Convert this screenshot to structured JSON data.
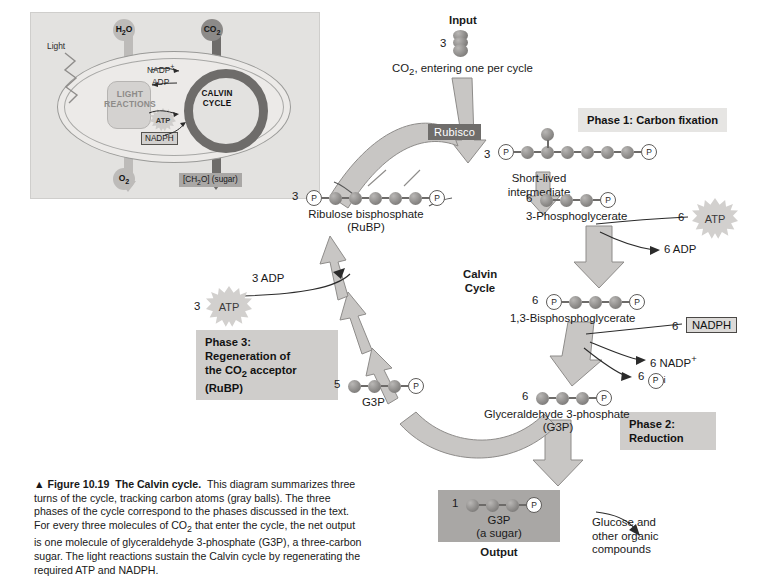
{
  "figure": {
    "number": "Figure 10.19",
    "title": "The Calvin cycle.",
    "caption": "This diagram summarizes three turns of the cycle, tracking carbon atoms (gray balls). The three phases of the cycle correspond to the phases discussed in the text. For every three molecules of CO2 that enter the cycle, the net output is one molecule of glyceraldehyde 3-phosphate (G3P), a three-carbon sugar. The light reactions sustain the Calvin cycle by regenerating the required ATP and NADPH.",
    "triangle": "▲"
  },
  "inset": {
    "h2o": "H2O",
    "co2": "CO2",
    "light": "Light",
    "light_reactions": "LIGHT REACTIONS",
    "calvin_cycle": "CALVIN CYCLE",
    "nadp_plus": "NADP+",
    "adp": "ADP",
    "atp": "ATP",
    "nadph": "NADPH",
    "o2": "O2",
    "sugar": "[CH2O] (sugar)"
  },
  "main": {
    "input_label": "Input",
    "input_count": "3",
    "input_text": "CO2, entering one per cycle",
    "enzyme": "Rubisco",
    "center_title": "Calvin Cycle",
    "output_label": "Output",
    "output_count": "1",
    "output_name": "G3P",
    "output_sub": "(a sugar)",
    "output_dest": "Glucose and other organic compounds",
    "phase1": "Phase 1: Carbon fixation",
    "phase2": "Phase 2: Reduction",
    "phase3": "Phase 3: Regeneration of the CO2 acceptor (RuBP)",
    "short_lived": "Short-lived intermediate"
  },
  "molecules": [
    {
      "id": "rubp",
      "count": "3",
      "name": "Ribulose bisphosphate",
      "sub": "(RuBP)",
      "carbons": 5,
      "p_left": true,
      "p_right": true
    },
    {
      "id": "intermediate",
      "count": "3",
      "name": "Short-lived intermediate",
      "sub": "",
      "carbons": 6,
      "p_left": true,
      "p_right": true
    },
    {
      "id": "pga",
      "count": "6",
      "name": "3-Phosphoglycerate",
      "sub": "",
      "carbons": 3,
      "p_left": false,
      "p_right": true
    },
    {
      "id": "bpg",
      "count": "6",
      "name": "1,3-Bisphosphoglycerate",
      "sub": "",
      "carbons": 3,
      "p_left": true,
      "p_right": true
    },
    {
      "id": "g3p-cycle",
      "count": "6",
      "name": "Glyceraldehyde 3-phosphate",
      "sub": "(G3P)",
      "carbons": 3,
      "p_left": false,
      "p_right": true
    },
    {
      "id": "g3p-regen",
      "count": "5",
      "name": "G3P",
      "sub": "",
      "carbons": 3,
      "p_left": false,
      "p_right": true
    },
    {
      "id": "g3p-output",
      "count": "1",
      "name": "G3P",
      "sub": "(a sugar)",
      "carbons": 3,
      "p_left": false,
      "p_right": true
    }
  ],
  "energy": {
    "atp_phase2_count": "6",
    "atp_phase2_label": "ATP",
    "adp_phase2": "6 ADP",
    "nadph_count": "6",
    "nadph_label": "NADPH",
    "nadp_out": "6 NADP+",
    "pi_out": "6 Pi",
    "atp_phase3_count": "3",
    "atp_phase3_label": "ATP",
    "adp_phase3": "3 ADP"
  },
  "colors": {
    "arrow_fill": "#c8c6c4",
    "arrow_stroke": "#8e8c8a",
    "phase_box": "#cfcdcb",
    "enzyme_box": "#6f6d6b",
    "carbon_ball": "#8e8c8a",
    "inset_bg": "#e3e2e0"
  }
}
